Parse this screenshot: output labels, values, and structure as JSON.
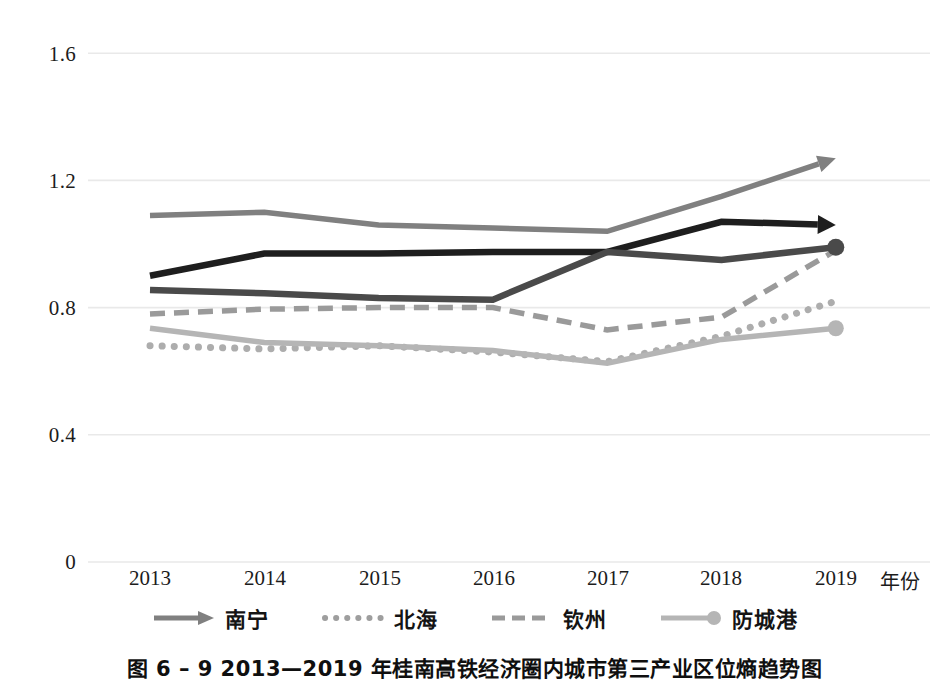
{
  "figure": {
    "caption": "图 6 – 9   2013—2019 年桂南高铁经济圈内城市第三产业区位熵趋势图",
    "xaxis_title": "年份"
  },
  "axis": {
    "y_ticks": [
      "0",
      "0.4",
      "0.8",
      "1.2",
      "1.6"
    ],
    "x_ticks": [
      "2013",
      "2014",
      "2015",
      "2016",
      "2017",
      "2018",
      "2019"
    ]
  },
  "legend": {
    "items": [
      {
        "label": "南宁",
        "style": "solid-arrow",
        "color": "#808080"
      },
      {
        "label": "北海",
        "style": "dotted",
        "color": "#adadad"
      },
      {
        "label": "钦州",
        "style": "dashed",
        "color": "#9a9a9a"
      },
      {
        "label": "防城港",
        "style": "solid-circle",
        "color": "#b5b5b5"
      }
    ]
  },
  "colors": {
    "nanning": "#808080",
    "beihai": "#adadad",
    "qinzhou": "#9a9a9a",
    "fangchenggang": "#b5b5b5",
    "dark_a": "#1e1e1e",
    "dark_b": "#4a4a4a",
    "gridline": "#e9e9e9",
    "background": "#ffffff"
  },
  "chart_data": {
    "type": "line",
    "title": "图 6 – 9   2013—2019 年桂南高铁经济圈内城市第三产业区位熵趋势图",
    "xlabel": "年份",
    "ylabel": "",
    "x": [
      "2013",
      "2014",
      "2015",
      "2016",
      "2017",
      "2018",
      "2019"
    ],
    "ylim": [
      0,
      1.6
    ],
    "yticks": [
      0,
      0.4,
      0.8,
      1.2,
      1.6
    ],
    "grid": true,
    "legend_position": "bottom",
    "series": [
      {
        "name": "南宁",
        "style": "solid-arrow",
        "color": "#808080",
        "values": [
          1.09,
          1.1,
          1.06,
          1.05,
          1.04,
          1.15,
          1.27
        ]
      },
      {
        "name": "北海",
        "style": "dotted",
        "color": "#adadad",
        "values": [
          0.68,
          0.67,
          0.68,
          0.66,
          0.63,
          0.71,
          0.82
        ]
      },
      {
        "name": "钦州",
        "style": "dashed",
        "color": "#9a9a9a",
        "values": [
          0.78,
          0.795,
          0.8,
          0.8,
          0.73,
          0.77,
          0.98
        ]
      },
      {
        "name": "防城港",
        "style": "solid-circle",
        "color": "#b5b5b5",
        "values": [
          0.735,
          0.69,
          0.68,
          0.665,
          0.625,
          0.7,
          0.735
        ]
      },
      {
        "name": "",
        "style": "solid-arrow-dark",
        "color": "#1e1e1e",
        "values": [
          0.9,
          0.97,
          0.97,
          0.975,
          0.975,
          1.07,
          1.06
        ]
      },
      {
        "name": "",
        "style": "solid-circle-dark",
        "color": "#4a4a4a",
        "values": [
          0.855,
          0.845,
          0.83,
          0.825,
          0.975,
          0.95,
          0.99
        ]
      }
    ]
  }
}
